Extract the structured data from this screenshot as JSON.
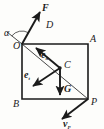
{
  "figure": {
    "type": "mechanics-free-body-diagram",
    "background_color": "#fdfdfb",
    "ink_color": "#1b1b1b"
  },
  "vertices": {
    "O": {
      "label": "O",
      "x": 22,
      "y": 44,
      "label_x": 13,
      "label_y": 49
    },
    "A": {
      "label": "A",
      "x": 88,
      "y": 44,
      "label_x": 90,
      "label_y": 42
    },
    "B": {
      "label": "B",
      "x": 22,
      "y": 99,
      "label_x": 13,
      "label_y": 107
    },
    "P": {
      "label": "P",
      "x": 88,
      "y": 99,
      "label_x": 91,
      "label_y": 105
    },
    "C": {
      "label": "C",
      "x": 60,
      "y": 68,
      "label_x": 64,
      "label_y": 68
    }
  },
  "region_labels": [
    {
      "name": "D",
      "label": "D",
      "x": 46,
      "y": 28
    }
  ],
  "angle": {
    "name": "alpha",
    "label": "α",
    "label_x": 4,
    "label_y": 36,
    "vertex_x": 22,
    "vertex_y": 44,
    "arc_radius": 13
  },
  "vectors": [
    {
      "name": "F",
      "label": "F",
      "from_x": 22,
      "from_y": 44,
      "to_x": 40,
      "to_y": 12,
      "label_x": 42,
      "label_y": 11,
      "bold": true,
      "subscript": ""
    },
    {
      "name": "e_n",
      "label": "e",
      "subscript": "n",
      "from_x": 60,
      "from_y": 68,
      "to_x": 36,
      "to_y": 48,
      "label_x": 41,
      "label_y": 58,
      "bold": true
    },
    {
      "name": "e_t",
      "label": "e",
      "subscript": "t",
      "from_x": 60,
      "from_y": 68,
      "to_x": 33,
      "to_y": 86,
      "label_x": 24,
      "label_y": 78,
      "bold": true
    },
    {
      "name": "G",
      "label": "G",
      "subscript": "",
      "from_x": 60,
      "from_y": 68,
      "to_x": 60,
      "to_y": 95,
      "label_x": 64,
      "label_y": 92,
      "bold": true
    },
    {
      "name": "v_P",
      "label": "v",
      "subscript": "P",
      "from_x": 88,
      "from_y": 99,
      "to_x": 62,
      "to_y": 119,
      "label_x": 63,
      "label_y": 127,
      "bold": true
    }
  ],
  "lines": {
    "square_stroke_width": 1.6,
    "diagonal_stroke_width": 0.8,
    "extension_stroke_width": 0.8,
    "diagonal": {
      "x1": 22,
      "y1": 44,
      "x2": 88,
      "y2": 99
    },
    "extension": {
      "x1": 22,
      "y1": 44,
      "x2": 7,
      "y2": 32
    }
  }
}
